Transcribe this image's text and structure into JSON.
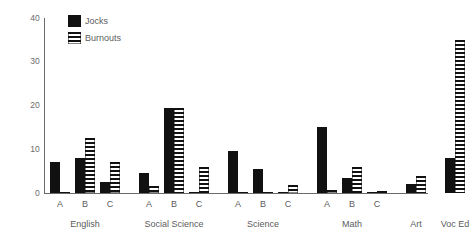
{
  "chart_data": {
    "type": "bar",
    "title": "",
    "subtitle": "",
    "xlabel": "",
    "ylabel": "",
    "ylim": [
      0,
      40
    ],
    "yticks": [
      0,
      10,
      20,
      30,
      40
    ],
    "ytick_labels": [
      "0",
      "10",
      "20",
      "30",
      "40"
    ],
    "grid": false,
    "legend_position": "top-left",
    "legend": [
      {
        "name": "Jocks",
        "style": "solid-black"
      },
      {
        "name": "Burnouts",
        "style": "horizontal-stripes"
      }
    ],
    "groups": [
      {
        "label": "English",
        "categories": [
          "A",
          "B",
          "C"
        ],
        "series": [
          {
            "name": "Jocks",
            "values": [
              7,
              8,
              2.5
            ]
          },
          {
            "name": "Burnouts",
            "values": [
              0.3,
              12.5,
              7
            ]
          }
        ]
      },
      {
        "label": "Social Science",
        "categories": [
          "A",
          "B",
          "C"
        ],
        "series": [
          {
            "name": "Jocks",
            "values": [
              4.5,
              19.5,
              0.2
            ]
          },
          {
            "name": "Burnouts",
            "values": [
              1.5,
              19.5,
              6
            ]
          }
        ]
      },
      {
        "label": "Science",
        "categories": [
          "A",
          "B",
          "C"
        ],
        "series": [
          {
            "name": "Jocks",
            "values": [
              9.5,
              5.5,
              0.3
            ]
          },
          {
            "name": "Burnouts",
            "values": [
              0.3,
              0.2,
              1.8
            ]
          }
        ]
      },
      {
        "label": "Math",
        "categories": [
          "A",
          "B",
          "C"
        ],
        "series": [
          {
            "name": "Jocks",
            "values": [
              15,
              3.5,
              0.2
            ]
          },
          {
            "name": "Burnouts",
            "values": [
              0.8,
              6,
              0.4
            ]
          }
        ]
      },
      {
        "label": "Art",
        "categories": [
          ""
        ],
        "series": [
          {
            "name": "Jocks",
            "values": [
              2
            ]
          },
          {
            "name": "Burnouts",
            "values": [
              4
            ]
          }
        ]
      },
      {
        "label": "Voc Ed",
        "categories": [
          ""
        ],
        "series": [
          {
            "name": "Jocks",
            "values": [
              8
            ]
          },
          {
            "name": "Burnouts",
            "values": [
              35
            ]
          }
        ]
      }
    ]
  },
  "colors": {
    "jocks": "#111111",
    "burnouts_stripe": "#111111",
    "axis": "#6b6b6b",
    "text": "#5c5c5c",
    "background": "#ffffff"
  }
}
